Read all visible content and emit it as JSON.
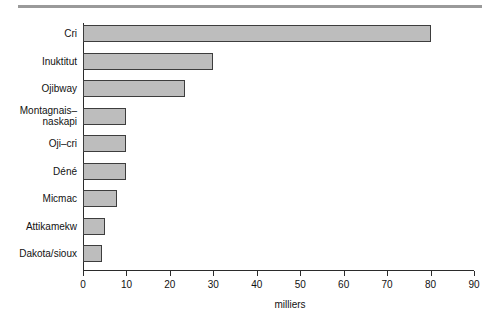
{
  "chart_data": {
    "type": "bar",
    "orientation": "horizontal",
    "title": "",
    "subtitle": "",
    "xlabel": "milliers",
    "ylabel": "",
    "categories": [
      "Cri",
      "Inuktitut",
      "Ojibway",
      "Montagnais–\nnaskapi",
      "Oji–cri",
      "Déné",
      "Micmac",
      "Attikamekw",
      "Dakota/sioux"
    ],
    "values": [
      80,
      30,
      23.5,
      10,
      10,
      10,
      7.8,
      5,
      4.4
    ],
    "xlim": [
      0,
      90
    ],
    "xticks": [
      0,
      10,
      20,
      30,
      40,
      50,
      60,
      70,
      80,
      90
    ],
    "xticklabels": [
      "0",
      "10",
      "20",
      "30",
      "40",
      "50",
      "60",
      "70",
      "80",
      "90"
    ],
    "grid": false,
    "legend": null,
    "bar_fill_color": "#bdbdbd",
    "bar_edge_color": "#3d3d3d",
    "axis_color": "#2b2b2b",
    "background_color": "#ffffff",
    "rule_color": "#9a9a9a"
  }
}
